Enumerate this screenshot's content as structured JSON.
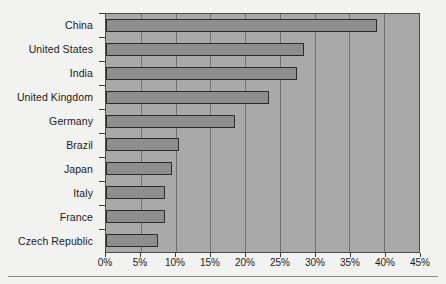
{
  "chart_data": {
    "type": "bar",
    "orientation": "horizontal",
    "title": "",
    "subtitle": "",
    "xlabel": "",
    "ylabel": "",
    "categories": [
      "China",
      "United States",
      "India",
      "United Kingdom",
      "Germany",
      "Brazil",
      "Japan",
      "Italy",
      "France",
      "Czech Republic"
    ],
    "values": [
      39.0,
      28.5,
      27.5,
      23.5,
      18.5,
      10.5,
      9.5,
      8.5,
      8.5,
      7.5
    ],
    "value_suffix": "%",
    "xlim": [
      0,
      45
    ],
    "xticks": [
      0,
      5,
      10,
      15,
      20,
      25,
      30,
      35,
      40,
      45
    ],
    "xtick_labels": [
      "0%",
      "5%",
      "10%",
      "15%",
      "20%",
      "25%",
      "30%",
      "35%",
      "40%",
      "45%"
    ],
    "grid": true,
    "grid_axis": "x",
    "legend": null,
    "legend_position": "none",
    "colors": {
      "plot_background": "#a9a9a9",
      "bar_fill": "#8e8e8e",
      "bar_edge": "#2b2b2b",
      "gridline": "#6f6f6f",
      "axis_line": "#4a4a4a",
      "text": "#1a1a1a",
      "figure_background": "#f2f2f0"
    }
  }
}
